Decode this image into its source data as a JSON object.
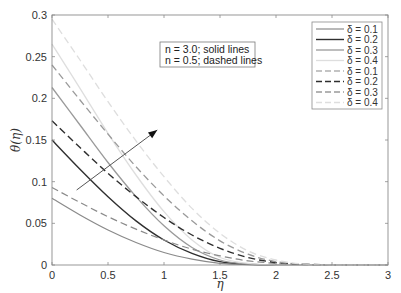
{
  "chart_data": {
    "type": "line",
    "title": "",
    "xlabel": "η",
    "ylabel": "θ(η)",
    "xlim": [
      0,
      3
    ],
    "ylim": [
      0,
      0.3
    ],
    "grid": false,
    "legend_position": "upper right",
    "x_ticks": [
      "0",
      "0.5",
      "1",
      "1.5",
      "2",
      "2.5",
      "3"
    ],
    "y_ticks": [
      "0",
      "0.05",
      "0.1",
      "0.15",
      "0.2",
      "0.25",
      "0.3"
    ],
    "x": [
      0,
      0.25,
      0.5,
      0.75,
      1.0,
      1.25,
      1.5,
      1.75,
      2.0,
      2.25,
      2.5,
      2.75,
      3.0
    ],
    "series": [
      {
        "name": "δ = 0.1",
        "group": "n = 3.0",
        "style": "solid",
        "color": "#8a8a8a",
        "width": 1.2,
        "values": [
          0.08,
          0.06,
          0.042,
          0.027,
          0.015,
          0.007,
          0.002,
          0.0005,
          0.0,
          0.0,
          0.0,
          0.0,
          0.0
        ]
      },
      {
        "name": "δ = 0.2",
        "group": "n = 3.0",
        "style": "solid",
        "color": "#2f2f2f",
        "width": 1.4,
        "values": [
          0.15,
          0.115,
          0.082,
          0.053,
          0.03,
          0.014,
          0.004,
          0.001,
          0.0,
          0.0,
          0.0,
          0.0,
          0.0
        ]
      },
      {
        "name": "δ = 0.3",
        "group": "n = 3.0",
        "style": "solid",
        "color": "#9a9a9a",
        "width": 1.3,
        "values": [
          0.213,
          0.168,
          0.123,
          0.082,
          0.047,
          0.021,
          0.006,
          0.001,
          0.0,
          0.0,
          0.0,
          0.0,
          0.0
        ]
      },
      {
        "name": "δ = 0.4",
        "group": "n = 3.0",
        "style": "solid",
        "color": "#dedede",
        "width": 1.3,
        "values": [
          0.265,
          0.212,
          0.158,
          0.108,
          0.064,
          0.03,
          0.009,
          0.002,
          0.0,
          0.0,
          0.0,
          0.0,
          0.0
        ]
      },
      {
        "name": "δ = 0.1",
        "group": "n = 0.5",
        "style": "dashed",
        "color": "#8a8a8a",
        "width": 1.2,
        "values": [
          0.093,
          0.075,
          0.058,
          0.043,
          0.03,
          0.019,
          0.011,
          0.005,
          0.002,
          0.0005,
          0.0,
          0.0,
          0.0
        ]
      },
      {
        "name": "δ = 0.2",
        "group": "n = 0.5",
        "style": "dashed",
        "color": "#2f2f2f",
        "width": 1.4,
        "values": [
          0.173,
          0.141,
          0.11,
          0.082,
          0.057,
          0.036,
          0.02,
          0.009,
          0.003,
          0.001,
          0.0,
          0.0,
          0.0
        ]
      },
      {
        "name": "δ = 0.3",
        "group": "n = 0.5",
        "style": "dashed",
        "color": "#9a9a9a",
        "width": 1.3,
        "values": [
          0.24,
          0.198,
          0.157,
          0.118,
          0.083,
          0.053,
          0.029,
          0.013,
          0.004,
          0.001,
          0.0,
          0.0,
          0.0
        ]
      },
      {
        "name": "δ = 0.4",
        "group": "n = 0.5",
        "style": "dashed",
        "color": "#dedede",
        "width": 1.3,
        "values": [
          0.295,
          0.246,
          0.196,
          0.149,
          0.106,
          0.068,
          0.038,
          0.017,
          0.006,
          0.001,
          0.0,
          0.0,
          0.0
        ]
      }
    ],
    "annotations": [
      {
        "type": "textbox",
        "lines": [
          "n = 3.0; solid lines",
          "n = 0.5; dashed lines"
        ]
      },
      {
        "type": "arrow",
        "from": [
          0.22,
          0.09
        ],
        "to": [
          0.94,
          0.162
        ],
        "meaning": "increasing δ"
      }
    ]
  },
  "legend": {
    "items": [
      {
        "label": "δ = 0.1"
      },
      {
        "label": "δ = 0.2"
      },
      {
        "label": "δ = 0.3"
      },
      {
        "label": "δ = 0.4"
      },
      {
        "label": "δ = 0.1"
      },
      {
        "label": "δ = 0.2"
      },
      {
        "label": "δ = 0.3"
      },
      {
        "label": "δ = 0.4"
      }
    ]
  },
  "annotation_box": {
    "line1": "n = 3.0; solid lines",
    "line2": "n = 0.5; dashed lines"
  },
  "axes": {
    "xlabel": "η",
    "ylabel": "θ(η)"
  }
}
